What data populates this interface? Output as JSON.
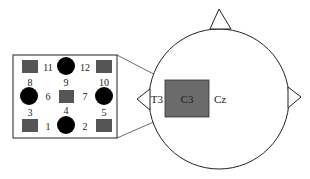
{
  "diagram": {
    "head": {
      "labels": {
        "t3": "T3",
        "c3": "C3",
        "cz": "Cz"
      }
    },
    "inset": {
      "electrodes": [
        {
          "id": "11",
          "label": "11"
        },
        {
          "id": "9",
          "label": "9"
        },
        {
          "id": "12",
          "label": "12"
        },
        {
          "id": "8",
          "label": "8"
        },
        {
          "id": "10",
          "label": "10"
        },
        {
          "id": "6",
          "label": "6"
        },
        {
          "id": "7",
          "label": "7"
        },
        {
          "id": "3",
          "label": "3"
        },
        {
          "id": "4",
          "label": "4"
        },
        {
          "id": "5",
          "label": "5"
        },
        {
          "id": "1",
          "label": "1"
        },
        {
          "id": "2",
          "label": "2"
        }
      ]
    },
    "colors": {
      "square_fill": "#555555",
      "c3_fill": "#6b6b6b",
      "circle_fill": "#000000",
      "stroke": "#222222"
    }
  }
}
